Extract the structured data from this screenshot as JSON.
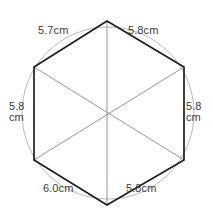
{
  "figure": {
    "shape": "hexagon-inscribed-in-circle",
    "background_color": "#ffffff",
    "circle": {
      "stroke_color": "#b9b9b9",
      "center_x": 108,
      "center_y": 113,
      "radius": 86
    },
    "hexagon": {
      "stroke_color": "#1e1e1e",
      "vertices": [
        {
          "name": "top",
          "x": 107,
          "y": 21
        },
        {
          "name": "upper-right",
          "x": 184,
          "y": 67
        },
        {
          "name": "lower-right",
          "x": 184,
          "y": 160
        },
        {
          "name": "bottom",
          "x": 107,
          "y": 205
        },
        {
          "name": "lower-left",
          "x": 34,
          "y": 160
        },
        {
          "name": "upper-left",
          "x": 34,
          "y": 67
        }
      ]
    },
    "diagonals": {
      "stroke_color": "#8a8a8a",
      "center": {
        "x": 108,
        "y": 113
      },
      "pairs": [
        [
          "top",
          "bottom"
        ],
        [
          "upper-left",
          "lower-right"
        ],
        [
          "upper-right",
          "lower-left"
        ]
      ]
    }
  },
  "measurements": {
    "unit": "cm",
    "sides": [
      {
        "position": "top-left",
        "value": "5.7",
        "label": "5.7cm",
        "stacked": false
      },
      {
        "position": "top-right",
        "value": "5.8",
        "label": "5.8cm",
        "stacked": false
      },
      {
        "position": "left",
        "value": "5.8",
        "label": "5.8",
        "unit_line": "cm",
        "stacked": true
      },
      {
        "position": "right",
        "value": "5.8",
        "label": "5.8",
        "unit_line": "cm",
        "stacked": true
      },
      {
        "position": "bottom-left",
        "value": "6.0",
        "label": "6.0cm",
        "stacked": false
      },
      {
        "position": "bottom-right",
        "value": "5.8",
        "label": "5.8cm",
        "stacked": false
      }
    ]
  }
}
